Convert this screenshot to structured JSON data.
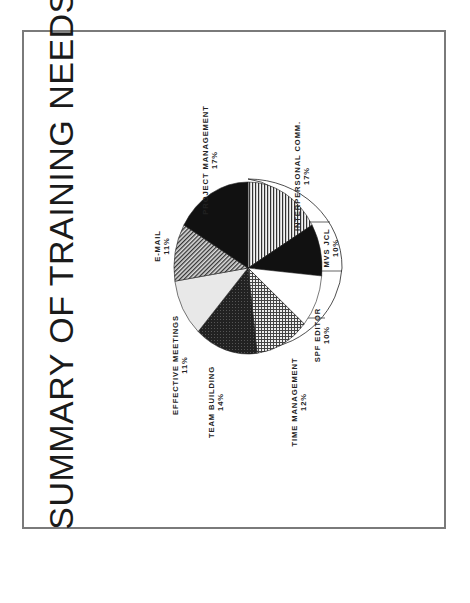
{
  "title": "SUMMARY OF TRAINING NEEDS",
  "chart_data": {
    "type": "pie",
    "title": "SUMMARY OF TRAINING NEEDS",
    "orientation": "rotated -90deg (page landscape scanned in portrait)",
    "style": "3D exploded-edge pie, monochrome hatch fills",
    "categories": [
      "INTERPERSONAL COMM.",
      "MVS JCL",
      "SPF EDITOR",
      "TIME MANAGEMENT",
      "TEAM BUILDING",
      "EFFECTIVE MEETINGS",
      "E-MAIL",
      "PROJECT MANAGEMENT"
    ],
    "values": [
      17,
      10,
      10,
      12,
      14,
      11,
      11,
      17
    ],
    "unit": "%",
    "fills": [
      "vertical-stripes",
      "black",
      "white",
      "crosshatch",
      "dark-gray",
      "light-gray",
      "diagonal-hatch",
      "black"
    ],
    "legend": "none (direct labels)"
  },
  "labels": [
    {
      "name": "INTERPERSONAL COMM.",
      "pct": "17%"
    },
    {
      "name": "MVS JCL",
      "pct": "10%"
    },
    {
      "name": "SPF EDITOR",
      "pct": "10%"
    },
    {
      "name": "TIME MANAGEMENT",
      "pct": "12%"
    },
    {
      "name": "TEAM BUILDING",
      "pct": "14%"
    },
    {
      "name": "EFFECTIVE MEETINGS",
      "pct": "11%"
    },
    {
      "name": "E-MAIL",
      "pct": "11%"
    },
    {
      "name": "PROJECT MANAGEMENT",
      "pct": "17%"
    }
  ],
  "colors": {
    "frame": "#7a7a7a",
    "ink": "#1a1a1a",
    "paper": "#ffffff"
  }
}
